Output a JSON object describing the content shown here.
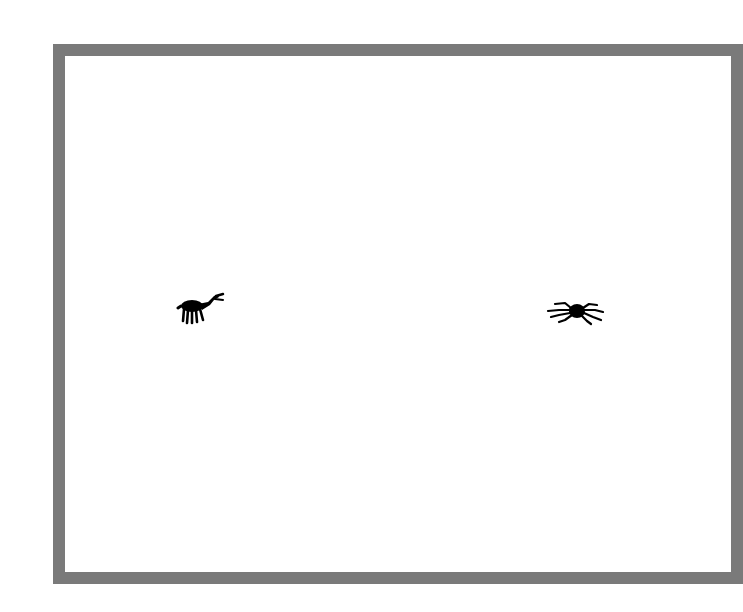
{
  "scene": {
    "arena": {
      "border_color": "#7a7a7a",
      "background_color": "#ffffff"
    },
    "creatures": [
      {
        "id": "left",
        "kind": "ant",
        "icon": "ant-icon",
        "color": "#000000",
        "label": "ant creature"
      },
      {
        "id": "right",
        "kind": "spider",
        "icon": "spider-icon",
        "color": "#000000",
        "label": "spider creature"
      }
    ]
  }
}
